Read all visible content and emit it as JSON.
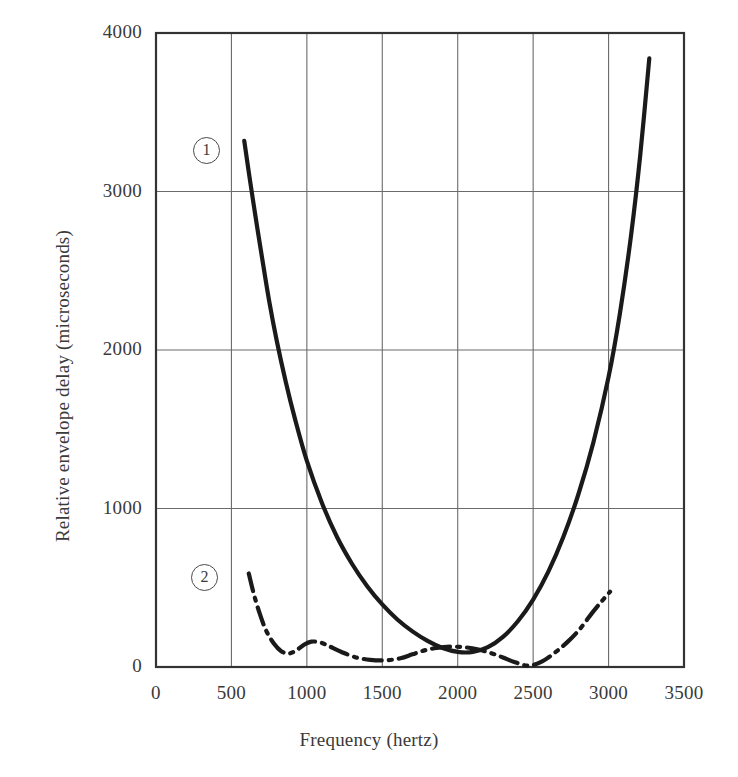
{
  "chart_data": {
    "type": "line",
    "title": "",
    "xlabel": "Frequency (hertz)",
    "ylabel": "Relative envelope delay (microseconds)",
    "xlim": [
      0,
      3500
    ],
    "ylim": [
      0,
      4000
    ],
    "xticks": [
      0,
      500,
      1000,
      1500,
      2000,
      2500,
      3000,
      3500
    ],
    "xtick_labels": [
      "0",
      "500",
      "1000",
      "1500",
      "2000",
      "2500",
      "3000",
      "3500"
    ],
    "yticks": [
      0,
      1000,
      2000,
      3000,
      4000
    ],
    "ytick_labels": [
      "0",
      "1000",
      "2000",
      "3000",
      "4000"
    ],
    "grid": true,
    "grid_color": "#6b6b6b",
    "frame_color": "#333333",
    "legend_position": "in-plot-annotations",
    "series": [
      {
        "name": "1",
        "label": "1",
        "style": "solid",
        "color": "#1a1a1a",
        "width": 4.2,
        "annotation": "1",
        "x": [
          585,
          620,
          660,
          700,
          750,
          800,
          860,
          920,
          1000,
          1100,
          1200,
          1300,
          1400,
          1500,
          1600,
          1700,
          1800,
          1900,
          2000,
          2100,
          2200,
          2300,
          2400,
          2500,
          2600,
          2700,
          2800,
          2900,
          3000,
          3075,
          3150,
          3210,
          3270
        ],
        "y": [
          3320,
          3090,
          2840,
          2600,
          2310,
          2060,
          1800,
          1570,
          1300,
          1035,
          820,
          650,
          510,
          395,
          300,
          225,
          165,
          120,
          95,
          95,
          125,
          190,
          290,
          425,
          600,
          820,
          1090,
          1420,
          1830,
          2230,
          2730,
          3230,
          3840
        ]
      },
      {
        "name": "2",
        "label": "2",
        "style": "dash-dot",
        "color": "#1a1a1a",
        "width": 4.2,
        "annotation": "2",
        "x": [
          615,
          650,
          690,
          730,
          780,
          830,
          880,
          930,
          980,
          1030,
          1090,
          1150,
          1230,
          1320,
          1420,
          1520,
          1620,
          1700,
          1780,
          1860,
          1950,
          2040,
          2130,
          2220,
          2300,
          2380,
          2470,
          2560,
          2650,
          2730,
          2810,
          2890,
          2950,
          3010
        ],
        "y": [
          590,
          455,
          330,
          230,
          150,
          100,
          85,
          105,
          140,
          160,
          155,
          130,
          95,
          62,
          45,
          42,
          55,
          80,
          105,
          120,
          128,
          125,
          112,
          88,
          60,
          30,
          8,
          35,
          95,
          160,
          240,
          340,
          410,
          475
        ]
      }
    ],
    "annotations": [
      {
        "text": "1",
        "x": 760,
        "y": 3600,
        "shape": "circle"
      },
      {
        "text": "2",
        "x": 750,
        "y": 920,
        "shape": "circle"
      }
    ]
  }
}
